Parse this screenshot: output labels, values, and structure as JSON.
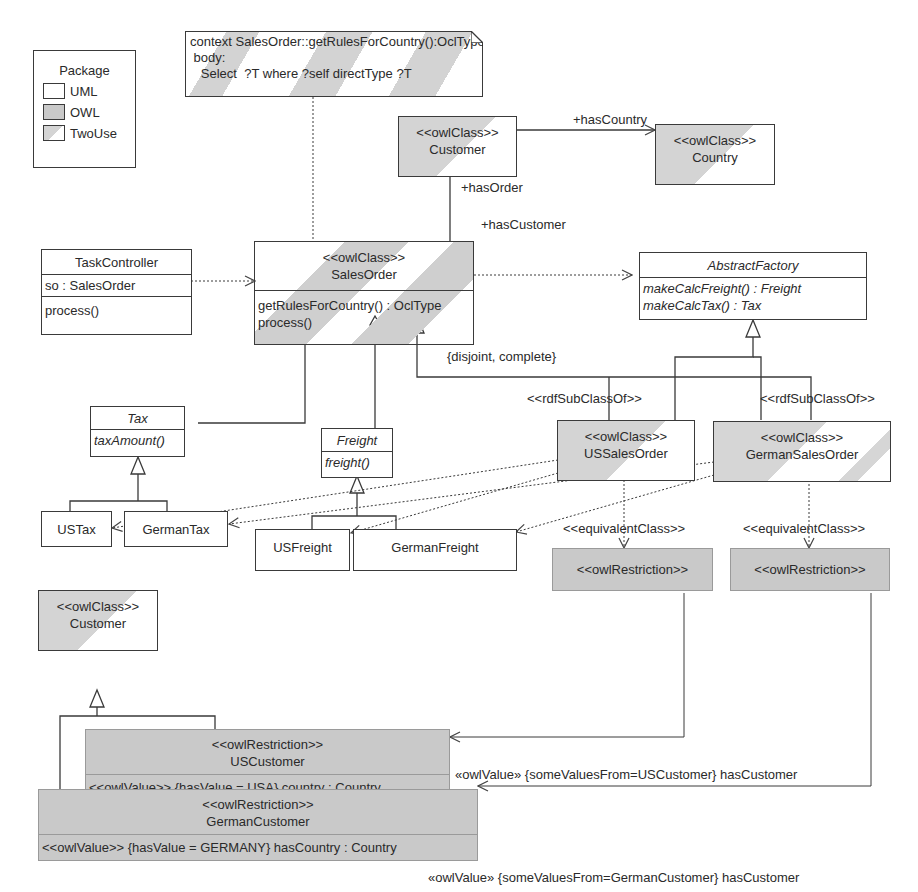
{
  "legend": {
    "title": "Package",
    "items": [
      {
        "label": "UML",
        "kind": "uml"
      },
      {
        "label": "OWL",
        "kind": "owl"
      },
      {
        "label": "TwoUse",
        "kind": "twouse"
      }
    ]
  },
  "note": {
    "line1": "context SalesOrder::getRulesForCountry():OclType",
    "line2": " body:",
    "line3": "   Select  ?T where ?self directType ?T"
  },
  "classes": {
    "customer_top": {
      "stereotype": "<<owlClass>>",
      "name": "Customer"
    },
    "country": {
      "stereotype": "<<owlClass>>",
      "name": "Country"
    },
    "task_controller": {
      "name": "TaskController",
      "attribute": "so : SalesOrder",
      "operation": "process()"
    },
    "sales_order": {
      "stereotype": "<<owlClass>>",
      "name": "SalesOrder",
      "op1": "getRulesForCountry() : OclType",
      "op2": "process()"
    },
    "abstract_factory": {
      "name": "AbstractFactory",
      "op1": "makeCalcFreight() : Freight",
      "op2": "makeCalcTax() : Tax"
    },
    "tax": {
      "name": "Tax",
      "operation": "taxAmount()"
    },
    "freight": {
      "name": "Freight",
      "operation": "freight()"
    },
    "us_tax": {
      "name": "USTax"
    },
    "german_tax": {
      "name": "GermanTax"
    },
    "us_freight": {
      "name": "USFreight"
    },
    "german_freight": {
      "name": "GermanFreight"
    },
    "us_sales_order": {
      "stereotype": "<<owlClass>>",
      "name": "USSalesOrder"
    },
    "german_sales_order": {
      "stereotype": "<<owlClass>>",
      "name": "GermanSalesOrder"
    },
    "restriction_us": {
      "stereotype": "<<owlRestriction>>"
    },
    "restriction_german": {
      "stereotype": "<<owlRestriction>>"
    },
    "customer_bottom": {
      "stereotype": "<<owlClass>>",
      "name": "Customer"
    },
    "us_customer": {
      "stereotype": "<<owlRestriction>>",
      "name": "USCustomer",
      "attribute": "<<owlValue>> {hasValue = USA} country : Country"
    },
    "german_customer": {
      "stereotype": "<<owlRestriction>>",
      "name": "GermanCustomer",
      "attribute": "<<owlValue>> {hasValue = GERMANY} hasCountry : Country"
    }
  },
  "labels": {
    "has_country": "+hasCountry",
    "has_order": "+hasOrder",
    "has_customer": "+hasCustomer",
    "disjoint_complete": "{disjoint, complete}",
    "rdf_subclass_us": "<<rdfSubClassOf>>",
    "rdf_subclass_german": "<<rdfSubClassOf>>",
    "equivalent_us": "<<equivalentClass>>",
    "equivalent_german": "<<equivalentClass>>",
    "owlvalue_us": "«owlValue» {someValuesFrom=USCustomer} hasCustomer",
    "owlvalue_german": "«owlValue» {someValuesFrom=GermanCustomer} hasCustomer"
  }
}
